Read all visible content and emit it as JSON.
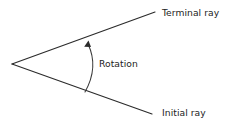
{
  "diagram": {
    "background_color": "#ffffff",
    "line_color": "#2b2b2b",
    "text_color": "#232323",
    "labels": {
      "terminal_ray": "Terminal ray",
      "initial_ray": "Initial ray",
      "rotation": "Rotation"
    },
    "geometry": {
      "vertex": [
        12,
        64
      ],
      "terminal_ray_end": [
        155,
        12
      ],
      "initial_ray_end": [
        152,
        114
      ],
      "arc_start": [
        85,
        92
      ],
      "arc_end": [
        88,
        42
      ],
      "arc_control": [
        99,
        67
      ],
      "arrow_tip": [
        88,
        41
      ],
      "arrow_direction": "toward-terminal-ray"
    }
  }
}
